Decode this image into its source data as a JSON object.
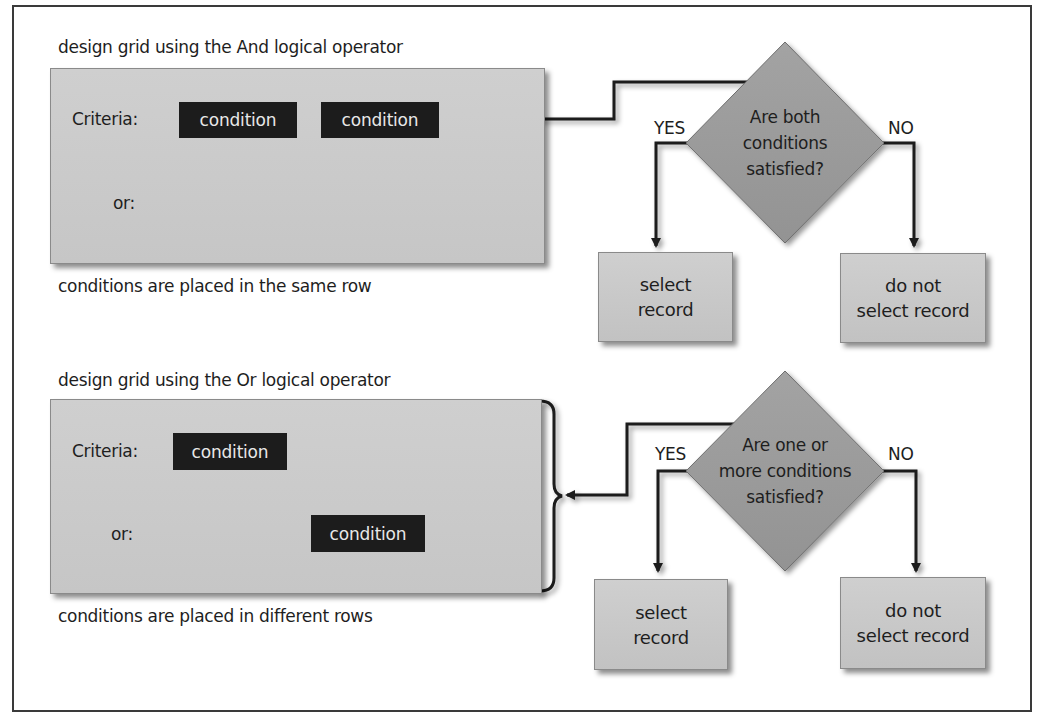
{
  "and_section": {
    "title": "design grid using the And logical operator",
    "criteria_label": "Criteria:",
    "or_label": "or:",
    "conditions": [
      "condition",
      "condition"
    ],
    "footer": "conditions are placed in the same row",
    "decision": {
      "question_lines": [
        "Are both",
        "conditions",
        "satisfied?"
      ],
      "yes_label": "YES",
      "no_label": "NO",
      "yes_result": [
        "select",
        "record"
      ],
      "no_result": [
        "do not",
        "select record"
      ]
    }
  },
  "or_section": {
    "title": "design grid using the Or logical operator",
    "criteria_label": "Criteria:",
    "or_label": "or:",
    "conditions": [
      "condition",
      "condition"
    ],
    "footer": "conditions are placed in different rows",
    "decision": {
      "question_lines": [
        "Are one or",
        "more conditions",
        "satisfied?"
      ],
      "yes_label": "YES",
      "no_label": "NO",
      "yes_result": [
        "select",
        "record"
      ],
      "no_result": [
        "do not",
        "select record"
      ]
    }
  },
  "colors": {
    "grid_fill": "#c9c9c9",
    "condition_fill": "#1c1c1c",
    "condition_text": "#e8e8e8",
    "diamond_fill": "#9a9a9a",
    "connector": "#1a1a1a",
    "frame": "#3a3a3a"
  }
}
